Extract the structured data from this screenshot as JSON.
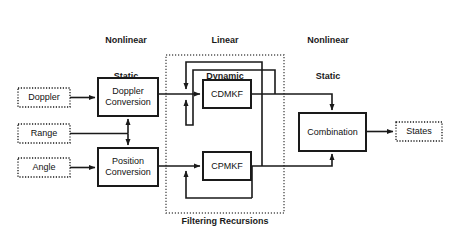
{
  "diagram": {
    "colors": {
      "stroke": "#1a1a1a",
      "text": "#111111",
      "background": "#ffffff",
      "dashed": "#555555"
    },
    "headers": [
      {
        "id": "header-nonlinear-static-left",
        "line1": "Nonlinear",
        "line2": "Static",
        "x": 86,
        "y": 10,
        "width": 80
      },
      {
        "id": "header-linear-dynamic",
        "line1": "Linear",
        "line2": "Dynamic",
        "x": 185,
        "y": 10,
        "width": 80
      },
      {
        "id": "header-nonlinear-static-right",
        "line1": "Nonlinear",
        "line2": "Static",
        "x": 288,
        "y": 10,
        "width": 80
      }
    ],
    "inputs": [
      {
        "id": "input-doppler",
        "label": "Doppler",
        "x": 18,
        "y": 88,
        "width": 52,
        "height": 19
      },
      {
        "id": "input-range",
        "label": "Range",
        "x": 18,
        "y": 124,
        "width": 52,
        "height": 19
      },
      {
        "id": "input-angle",
        "label": "Angle",
        "x": 18,
        "y": 158,
        "width": 52,
        "height": 19
      }
    ],
    "blocks": [
      {
        "id": "block-doppler-conversion",
        "label": "Doppler\nConversion",
        "x": 98,
        "y": 78,
        "width": 60,
        "height": 38
      },
      {
        "id": "block-position-conversion",
        "label": "Position\nConversion",
        "x": 98,
        "y": 148,
        "width": 60,
        "height": 38
      },
      {
        "id": "block-cdmkf",
        "label": "CDMKF",
        "x": 203,
        "y": 80,
        "width": 48,
        "height": 28
      },
      {
        "id": "block-cpmkf",
        "label": "CPMKF",
        "x": 203,
        "y": 152,
        "width": 48,
        "height": 28
      },
      {
        "id": "block-combination",
        "label": "Combination",
        "x": 299,
        "y": 113,
        "width": 67,
        "height": 38
      }
    ],
    "outputs": [
      {
        "id": "output-states",
        "label": "States",
        "x": 396,
        "y": 122,
        "width": 46,
        "height": 19
      }
    ],
    "groups": [
      {
        "id": "group-filtering-recursions",
        "label": "Filtering Recursions",
        "x": 166,
        "y": 55,
        "width": 118,
        "height": 158,
        "label_x": 166,
        "label_y": 216,
        "label_width": 118
      }
    ]
  }
}
